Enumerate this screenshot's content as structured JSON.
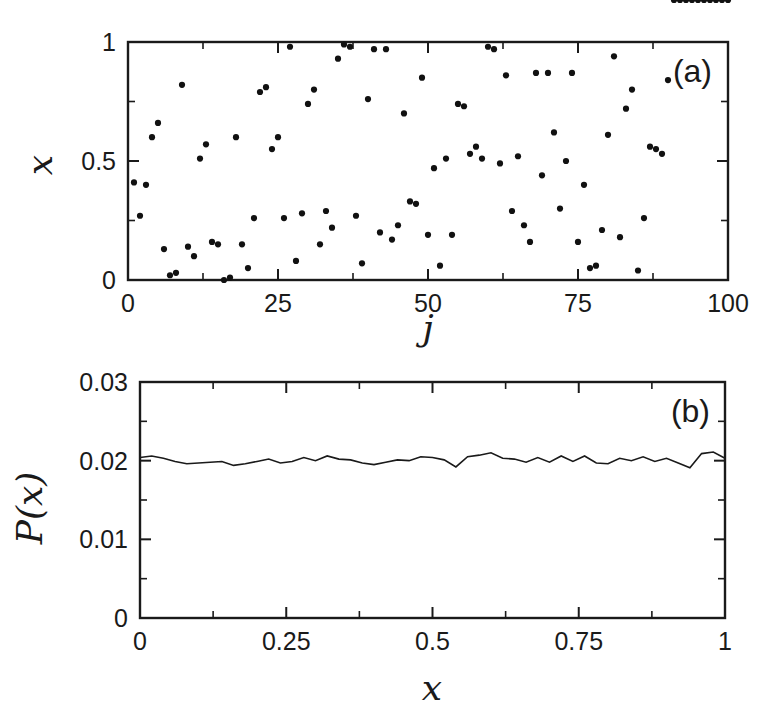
{
  "figure": {
    "background_color": "#ffffff",
    "ink_color": "#1a1a1a",
    "width": 780,
    "height": 714
  },
  "chart_data": [
    {
      "type": "scatter",
      "panel_label": "(a)",
      "title": "",
      "xlabel": "j",
      "ylabel": "x",
      "xlim": [
        0,
        100
      ],
      "ylim": [
        0,
        1
      ],
      "grid": false,
      "legend": null,
      "xticks": [
        0,
        25,
        50,
        75,
        100
      ],
      "xticklabels": [
        "0",
        "25",
        "50",
        "75",
        "100"
      ],
      "xminorticks": [
        12.5,
        37.5,
        62.5,
        87.5
      ],
      "yticks": [
        0,
        0.5,
        1
      ],
      "yticklabels": [
        "0",
        "0.5",
        "1"
      ],
      "yminorticks": [
        0.25,
        0.75
      ],
      "marker": "filled-circle",
      "marker_color": "#111111",
      "x": [
        1,
        2,
        3,
        4,
        5,
        6,
        7,
        8,
        9,
        10,
        11,
        12,
        13,
        14,
        15,
        16,
        17,
        18,
        19,
        20,
        21,
        22,
        23,
        24,
        25,
        26,
        27,
        28,
        29,
        30,
        31,
        32,
        33,
        34,
        35,
        36,
        37,
        38,
        39,
        40,
        41,
        42,
        43,
        44,
        45,
        46,
        47,
        48,
        49,
        50,
        51,
        52,
        53,
        54,
        55,
        56,
        57,
        58,
        59,
        60,
        61,
        62,
        63,
        64,
        65,
        66,
        67,
        68,
        69,
        70,
        71,
        72,
        73,
        74,
        75,
        76,
        77,
        78,
        79,
        80,
        81,
        82,
        83,
        84,
        85,
        86,
        87,
        88,
        89,
        90,
        91,
        92,
        93,
        94,
        95,
        96,
        97,
        98,
        99,
        100
      ],
      "y": [
        0.41,
        0.27,
        0.4,
        0.6,
        0.66,
        0.13,
        0.02,
        0.03,
        0.82,
        0.14,
        0.1,
        0.51,
        0.57,
        0.16,
        0.15,
        0.0,
        0.01,
        0.6,
        0.15,
        0.05,
        0.26,
        0.79,
        0.81,
        0.55,
        0.6,
        0.26,
        0.98,
        0.08,
        0.28,
        0.74,
        0.8,
        0.15,
        0.29,
        0.22,
        0.93,
        0.99,
        0.98,
        0.27,
        0.07,
        0.76,
        0.97,
        0.2,
        0.97,
        0.17,
        0.23,
        0.7,
        0.33,
        0.32,
        0.85,
        0.19,
        0.47,
        0.06,
        0.51,
        0.19,
        0.74,
        0.73,
        0.53,
        0.56,
        0.51,
        0.98,
        0.97,
        0.49,
        0.86,
        0.29,
        0.52,
        0.23,
        0.16,
        0.87,
        0.44,
        0.87,
        0.62,
        0.3,
        0.5,
        0.87,
        0.16,
        0.4,
        0.05,
        0.06,
        0.21,
        0.61,
        0.94,
        0.18,
        0.72,
        0.8,
        0.04,
        0.26,
        0.56,
        0.55,
        0.53,
        0.84
      ]
    },
    {
      "type": "line",
      "panel_label": "(b)",
      "title": "",
      "xlabel": "x",
      "ylabel": "P(x)",
      "xlim": [
        0,
        1
      ],
      "ylim": [
        0,
        0.03
      ],
      "grid": false,
      "legend": null,
      "xticks": [
        0,
        0.25,
        0.5,
        0.75,
        1
      ],
      "xticklabels": [
        "0",
        "0.25",
        "0.5",
        "0.75",
        "1"
      ],
      "xminorticks": [
        0.125,
        0.375,
        0.625,
        0.875
      ],
      "yticks": [
        0,
        0.01,
        0.02,
        0.03
      ],
      "yticklabels": [
        "0",
        "0.01",
        "0.02",
        "0.03"
      ],
      "yminorticks": [
        0.005,
        0.015,
        0.025
      ],
      "line_color": "#1a1a1a",
      "x": [
        0.0,
        0.02,
        0.04,
        0.06,
        0.08,
        0.1,
        0.12,
        0.14,
        0.16,
        0.18,
        0.2,
        0.22,
        0.24,
        0.26,
        0.28,
        0.3,
        0.32,
        0.34,
        0.36,
        0.38,
        0.4,
        0.42,
        0.44,
        0.46,
        0.48,
        0.5,
        0.52,
        0.54,
        0.56,
        0.58,
        0.6,
        0.62,
        0.64,
        0.66,
        0.68,
        0.7,
        0.72,
        0.74,
        0.76,
        0.78,
        0.8,
        0.82,
        0.84,
        0.86,
        0.88,
        0.9,
        0.92,
        0.94,
        0.96,
        0.98,
        1.0
      ],
      "y": [
        0.0204,
        0.0206,
        0.0203,
        0.0199,
        0.0196,
        0.0197,
        0.0198,
        0.0199,
        0.0194,
        0.0196,
        0.0199,
        0.0202,
        0.0197,
        0.0199,
        0.0204,
        0.02,
        0.0206,
        0.0202,
        0.0201,
        0.0197,
        0.0195,
        0.0198,
        0.0201,
        0.02,
        0.0205,
        0.0204,
        0.0201,
        0.0192,
        0.0205,
        0.0207,
        0.021,
        0.0203,
        0.0202,
        0.0198,
        0.0204,
        0.0198,
        0.0206,
        0.0199,
        0.0206,
        0.0197,
        0.0196,
        0.0203,
        0.02,
        0.0205,
        0.0199,
        0.0203,
        0.0197,
        0.0191,
        0.0209,
        0.0211,
        0.0203
      ]
    }
  ]
}
